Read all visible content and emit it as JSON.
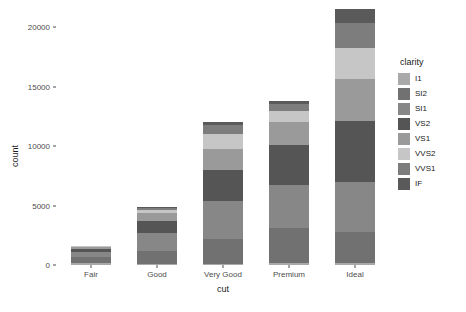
{
  "chart_data": {
    "type": "bar",
    "stacked": true,
    "title": "",
    "subtitle": "",
    "xlabel": "cut",
    "ylabel": "count",
    "categories": [
      "Fair",
      "Good",
      "Very Good",
      "Premium",
      "Ideal"
    ],
    "xticks": [
      "Fair",
      "Good",
      "Very Good",
      "Premium",
      "Ideal"
    ],
    "yticks": [
      "0",
      "5000",
      "10000",
      "15000",
      "20000"
    ],
    "ytick_values": [
      0,
      5000,
      10000,
      15000,
      20000
    ],
    "ylim": [
      0,
      21800
    ],
    "grid": false,
    "legend_title": "clarity",
    "legend_position": "right",
    "series": [
      {
        "name": "I1",
        "color": "#a9a9a9",
        "values": [
          210,
          96,
          84,
          205,
          146
        ]
      },
      {
        "name": "SI2",
        "color": "#717171",
        "values": [
          466,
          1081,
          2100,
          2949,
          2598
        ]
      },
      {
        "name": "SI1",
        "color": "#878787",
        "values": [
          408,
          1560,
          3240,
          3575,
          4282
        ]
      },
      {
        "name": "VS2",
        "color": "#555555",
        "values": [
          261,
          978,
          2591,
          3357,
          5071
        ]
      },
      {
        "name": "VS1",
        "color": "#9a9a9a",
        "values": [
          170,
          648,
          1775,
          1989,
          3589
        ]
      },
      {
        "name": "VVS2",
        "color": "#c6c6c6",
        "values": [
          69,
          286,
          1235,
          870,
          2606
        ]
      },
      {
        "name": "VVS1",
        "color": "#7d7d7d",
        "values": [
          17,
          186,
          789,
          616,
          2047
        ]
      },
      {
        "name": "IF",
        "color": "#5a5a5a",
        "values": [
          9,
          71,
          268,
          230,
          1212
        ]
      }
    ],
    "totals": [
      1610,
      4906,
      12082,
      13791,
      21551
    ]
  },
  "legend": {
    "title": "clarity",
    "items": [
      {
        "label": "I1",
        "color": "#a9a9a9"
      },
      {
        "label": "SI2",
        "color": "#717171"
      },
      {
        "label": "SI1",
        "color": "#878787"
      },
      {
        "label": "VS2",
        "color": "#555555"
      },
      {
        "label": "VS1",
        "color": "#9a9a9a"
      },
      {
        "label": "VVS2",
        "color": "#c6c6c6"
      },
      {
        "label": "VVS1",
        "color": "#7d7d7d"
      },
      {
        "label": "IF",
        "color": "#5a5a5a"
      }
    ]
  },
  "axes": {
    "x_title": "cut",
    "y_title": "count"
  },
  "colors": {
    "background": "#ffffff",
    "axis_text": "#4d4d4d",
    "axis_title": "#1a1a1a"
  }
}
